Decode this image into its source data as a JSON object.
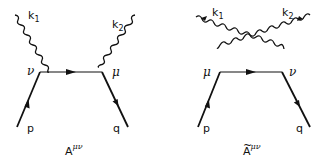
{
  "diagrams": [
    {
      "id": "direct",
      "caption": "A",
      "caption_superscript": "μν",
      "caption_tilde": false,
      "photons": [
        {
          "label": "k",
          "subscript": "1"
        },
        {
          "label": "k",
          "subscript": "2"
        }
      ],
      "vertices": [
        {
          "label": "ν"
        },
        {
          "label": "μ"
        }
      ],
      "fermions": [
        {
          "label": "p"
        },
        {
          "label": "q"
        }
      ]
    },
    {
      "id": "crossed",
      "caption": "A",
      "caption_superscript": "μν",
      "caption_tilde": true,
      "tilde": "~",
      "photons": [
        {
          "label": "k",
          "subscript": "1"
        },
        {
          "label": "k",
          "subscript": "2"
        }
      ],
      "vertices": [
        {
          "label": "μ"
        },
        {
          "label": "ν"
        }
      ],
      "fermions": [
        {
          "label": "p"
        },
        {
          "label": "q"
        }
      ]
    }
  ]
}
